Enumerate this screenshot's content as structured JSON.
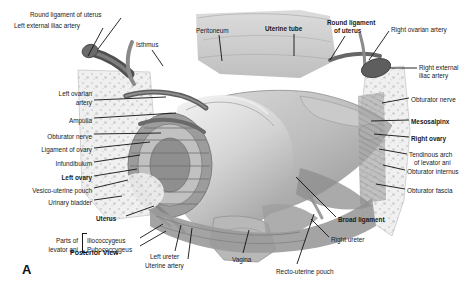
{
  "figure": {
    "panel_letter": "A",
    "view_caption": "Posterior View",
    "title_subject": "Female pelvis — posterior view of uterus, broad ligament and ovaries",
    "background_color": "#ffffff",
    "text_color": "#1a1a1a",
    "leader_color": "#111111"
  },
  "labels": [
    {
      "id": "round-ligament-of-uterus-left",
      "text": "Round ligament of uterus",
      "x": 30,
      "y": 11,
      "align": "left",
      "bold": false
    },
    {
      "id": "left-external-iliac-artery",
      "text": "Left external iliac artery",
      "x": 14,
      "y": 22,
      "align": "left",
      "bold": false
    },
    {
      "id": "isthmus",
      "text": "Isthmus",
      "x": 136,
      "y": 41,
      "align": "left",
      "bold": false
    },
    {
      "id": "peritoneum",
      "text": "Peritoneum",
      "x": 196,
      "y": 27,
      "align": "left",
      "bold": false
    },
    {
      "id": "uterine-tube",
      "text": "Uterine tube",
      "x": 265,
      "y": 25,
      "align": "left",
      "bold": true
    },
    {
      "id": "round-ligament-of-uterus-right-1",
      "text": "Round ligament",
      "x": 327,
      "y": 19,
      "align": "left",
      "bold": true
    },
    {
      "id": "round-ligament-of-uterus-right-2",
      "text": "of uterus",
      "x": 334,
      "y": 27,
      "align": "left",
      "bold": true
    },
    {
      "id": "right-ovarian-artery",
      "text": "Right ovarian artery",
      "x": 391,
      "y": 26,
      "align": "left",
      "bold": false
    },
    {
      "id": "right-external-iliac-artery-1",
      "text": "Right external",
      "x": 419,
      "y": 64,
      "align": "left",
      "bold": false
    },
    {
      "id": "right-external-iliac-artery-2",
      "text": "iliac artery",
      "x": 419,
      "y": 72,
      "align": "left",
      "bold": false
    },
    {
      "id": "obturator-nerve-right",
      "text": "Obturator nerve",
      "x": 411,
      "y": 96,
      "align": "left",
      "bold": false
    },
    {
      "id": "mesosalpinx",
      "text": "Mesosalpinx",
      "x": 411,
      "y": 118,
      "align": "left",
      "bold": true
    },
    {
      "id": "right-ovary",
      "text": "Right ovary",
      "x": 411,
      "y": 135,
      "align": "left",
      "bold": true
    },
    {
      "id": "tendinous-arch-1",
      "text": "Tendinous arch",
      "x": 409,
      "y": 151,
      "align": "left",
      "bold": false
    },
    {
      "id": "tendinous-arch-2",
      "text": "of levator ani",
      "x": 414,
      "y": 159,
      "align": "left",
      "bold": false
    },
    {
      "id": "obturator-internus",
      "text": "Obturator internus",
      "x": 407,
      "y": 168,
      "align": "left",
      "bold": false
    },
    {
      "id": "obturator-fascia",
      "text": "Obturator fascia",
      "x": 407,
      "y": 187,
      "align": "left",
      "bold": false
    },
    {
      "id": "broad-ligament",
      "text": "Broad ligament",
      "x": 338,
      "y": 216,
      "align": "left",
      "bold": true
    },
    {
      "id": "right-ureter",
      "text": "Right ureter",
      "x": 331,
      "y": 236,
      "align": "left",
      "bold": false
    },
    {
      "id": "recto-uterine-pouch",
      "text": "Recto-uterine pouch",
      "x": 276,
      "y": 268,
      "align": "left",
      "bold": false
    },
    {
      "id": "vagina",
      "text": "Vagina",
      "x": 232,
      "y": 256,
      "align": "left",
      "bold": false
    },
    {
      "id": "uterine-artery",
      "text": "Uterine artery",
      "x": 145,
      "y": 262,
      "align": "left",
      "bold": false
    },
    {
      "id": "left-ureter",
      "text": "Left ureter",
      "x": 150,
      "y": 253,
      "align": "left",
      "bold": false
    },
    {
      "id": "pubococcygeus",
      "text": "Pubococcygeus",
      "x": 87,
      "y": 246,
      "align": "left",
      "bold": false
    },
    {
      "id": "iliococcygeus",
      "text": "Iliococcygeus",
      "x": 87,
      "y": 237,
      "align": "left",
      "bold": false
    },
    {
      "id": "parts-of-levator-ani-1",
      "text": "Parts of",
      "x": 78,
      "y": 237,
      "align": "right",
      "bold": false
    },
    {
      "id": "parts-of-levator-ani-2",
      "text": "levator ani",
      "x": 78,
      "y": 246,
      "align": "right",
      "bold": false
    },
    {
      "id": "uterus",
      "text": "Uterus",
      "x": 96,
      "y": 215,
      "align": "left",
      "bold": true
    },
    {
      "id": "urinary-bladder",
      "text": "Urinary bladder",
      "x": 92,
      "y": 199,
      "align": "right",
      "bold": false
    },
    {
      "id": "vesico-uterine-pouch",
      "text": "Vesico-uterine pouch",
      "x": 92,
      "y": 187,
      "align": "right",
      "bold": false
    },
    {
      "id": "left-ovary",
      "text": "Left ovary",
      "x": 92,
      "y": 174,
      "align": "right",
      "bold": true
    },
    {
      "id": "infundibulum",
      "text": "Infundibulum",
      "x": 92,
      "y": 160,
      "align": "right",
      "bold": false
    },
    {
      "id": "ligament-of-ovary",
      "text": "Ligament of ovary",
      "x": 92,
      "y": 146,
      "align": "right",
      "bold": false
    },
    {
      "id": "obturator-nerve-left",
      "text": "Obturator nerve",
      "x": 92,
      "y": 133,
      "align": "right",
      "bold": false
    },
    {
      "id": "ampulla",
      "text": "Ampulla",
      "x": 92,
      "y": 117,
      "align": "right",
      "bold": false
    },
    {
      "id": "left-ovarian-artery-1",
      "text": "Left ovarian",
      "x": 92,
      "y": 90,
      "align": "right",
      "bold": false
    },
    {
      "id": "left-ovarian-artery-2",
      "text": "artery",
      "x": 92,
      "y": 99,
      "align": "right",
      "bold": false
    }
  ],
  "leader_lines": [
    {
      "id": "leader-round-ligament-left",
      "points": "121,18 98,49"
    },
    {
      "id": "leader-left-external-iliac",
      "points": "103,28 88,56"
    },
    {
      "id": "leader-isthmus",
      "points": "152,50 163,66"
    },
    {
      "id": "leader-peritoneum",
      "points": "219,35 222,61"
    },
    {
      "id": "leader-uterine-tube",
      "points": "294,34 294,56"
    },
    {
      "id": "leader-round-ligament-right",
      "points": "345,36 330,60"
    },
    {
      "id": "leader-right-ovarian-artery",
      "points": "389,31 369,60"
    },
    {
      "id": "leader-right-external-iliac",
      "points": "417,68 390,68"
    },
    {
      "id": "leader-obturator-nerve-right",
      "points": "409,98 382,103"
    },
    {
      "id": "leader-mesosalpinx",
      "points": "409,120 371,121"
    },
    {
      "id": "leader-right-ovary",
      "points": "409,137 374,134"
    },
    {
      "id": "leader-tendinous-arch",
      "points": "407,154 379,149"
    },
    {
      "id": "leader-obturator-internus",
      "points": "405,170 383,165"
    },
    {
      "id": "leader-obturator-fascia",
      "points": "405,189 376,184"
    },
    {
      "id": "leader-broad-ligament",
      "points": "336,217 296,177"
    },
    {
      "id": "leader-right-ureter",
      "points": "329,237 311,219"
    },
    {
      "id": "leader-recto-uterine-pouch",
      "points": "297,264 314,214"
    },
    {
      "id": "leader-vagina",
      "points": "243,253 249,230"
    },
    {
      "id": "leader-left-ureter",
      "points": "175,251 181,225"
    },
    {
      "id": "leader-uterine-artery",
      "points": "188,259 192,228"
    },
    {
      "id": "leader-iliococcygeus",
      "points": "140,238 163,224"
    },
    {
      "id": "leader-pubococcygeus",
      "points": "140,246 166,231"
    },
    {
      "id": "leader-uterus",
      "points": "126,216 154,206"
    },
    {
      "id": "leader-urinary-bladder",
      "points": "94,200 122,196"
    },
    {
      "id": "leader-vesico-uterine-pouch",
      "points": "94,188 128,180"
    },
    {
      "id": "leader-left-ovary",
      "points": "94,176 137,169"
    },
    {
      "id": "leader-infundibulum",
      "points": "94,162 140,155"
    },
    {
      "id": "leader-ligament-of-ovary",
      "points": "94,148 150,142"
    },
    {
      "id": "leader-obturator-nerve-left",
      "points": "94,134 161,133"
    },
    {
      "id": "leader-ampulla",
      "points": "94,118 176,113"
    },
    {
      "id": "leader-left-ovarian-artery",
      "points": "94,100 166,97"
    }
  ],
  "bracket": {
    "id": "levator-ani-bracket",
    "x": 82,
    "y": 233,
    "width": 4,
    "height": 18
  }
}
